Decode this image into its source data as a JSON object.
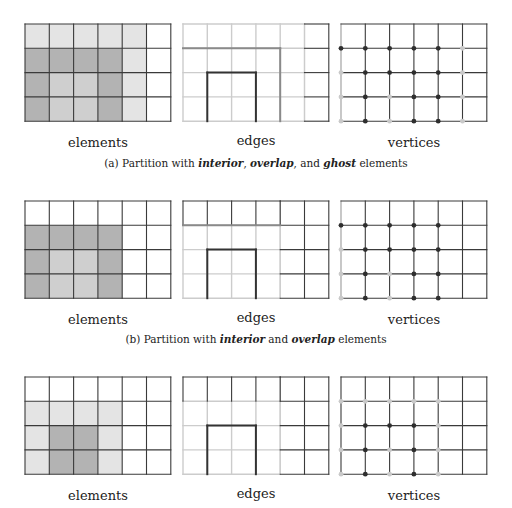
{
  "colors": {
    "interior": "#b3b3b3",
    "overlap": "#cfcfcf",
    "ghost": "#e4e4e4",
    "none": "#ffffff",
    "line_dark": "#333333",
    "line_overlap": "#8a8a8a",
    "line_ghost": "#cccccc",
    "line_plain": "#3a3a3a",
    "dot_dark": "#2e2e2e",
    "dot_light": "#c9c9c9"
  },
  "panel_labels": {
    "elements": "elements",
    "edges": "edges",
    "vertices": "vertices"
  },
  "subfigures": [
    {
      "id": "a",
      "caption": {
        "prefix": "(a) Partition with ",
        "t1": "interior",
        "sep1": ", ",
        "t2": "overlap",
        "sep2": ", and ",
        "t3": "ghost",
        "suffix": " elements"
      },
      "elements": [
        [
          "ghost",
          "ghost",
          "ghost",
          "ghost",
          "ghost",
          "none"
        ],
        [
          "interior",
          "interior",
          "interior",
          "interior",
          "ghost",
          "none"
        ],
        [
          "interior",
          "overlap",
          "overlap",
          "interior",
          "ghost",
          "none"
        ],
        [
          "interior",
          "overlap",
          "overlap",
          "interior",
          "ghost",
          "none"
        ]
      ],
      "edges": {
        "base": "line_ghost",
        "plain_cols_from": 5,
        "segments": [
          {
            "type": "h",
            "row": 1,
            "c0": 0,
            "c1": 4,
            "color": "line_overlap"
          },
          {
            "type": "v",
            "col": 4,
            "r0": 1,
            "r1": 4,
            "color": "line_overlap"
          },
          {
            "type": "h",
            "row": 2,
            "c0": 1,
            "c1": 3,
            "color": "line_dark"
          },
          {
            "type": "v",
            "col": 1,
            "r0": 2,
            "r1": 4,
            "color": "line_dark"
          },
          {
            "type": "v",
            "col": 3,
            "r0": 2,
            "r1": 4,
            "color": "line_dark"
          }
        ]
      },
      "vertices": {
        "ghost_left": true,
        "dots": [
          {
            "r": 1,
            "c": 0,
            "k": "dark"
          },
          {
            "r": 1,
            "c": 1,
            "k": "dark"
          },
          {
            "r": 1,
            "c": 2,
            "k": "dark"
          },
          {
            "r": 1,
            "c": 3,
            "k": "dark"
          },
          {
            "r": 1,
            "c": 4,
            "k": "dark"
          },
          {
            "r": 1,
            "c": 5,
            "k": "light"
          },
          {
            "r": 2,
            "c": 0,
            "k": "light"
          },
          {
            "r": 2,
            "c": 1,
            "k": "dark"
          },
          {
            "r": 2,
            "c": 2,
            "k": "dark"
          },
          {
            "r": 2,
            "c": 3,
            "k": "dark"
          },
          {
            "r": 2,
            "c": 4,
            "k": "dark"
          },
          {
            "r": 2,
            "c": 5,
            "k": "light"
          },
          {
            "r": 3,
            "c": 0,
            "k": "light"
          },
          {
            "r": 3,
            "c": 1,
            "k": "dark"
          },
          {
            "r": 3,
            "c": 2,
            "k": "light"
          },
          {
            "r": 3,
            "c": 3,
            "k": "dark"
          },
          {
            "r": 3,
            "c": 4,
            "k": "dark"
          },
          {
            "r": 3,
            "c": 5,
            "k": "light"
          },
          {
            "r": 4,
            "c": 0,
            "k": "light"
          },
          {
            "r": 4,
            "c": 1,
            "k": "dark"
          },
          {
            "r": 4,
            "c": 2,
            "k": "light"
          },
          {
            "r": 4,
            "c": 3,
            "k": "dark"
          },
          {
            "r": 4,
            "c": 4,
            "k": "dark"
          },
          {
            "r": 4,
            "c": 5,
            "k": "light"
          }
        ]
      }
    },
    {
      "id": "b",
      "caption": {
        "prefix": "(b) Partition with ",
        "t1": "interior",
        "sep1": " and ",
        "t2": "overlap",
        "sep2": "",
        "t3": "",
        "suffix": " elements"
      },
      "elements": [
        [
          "none",
          "none",
          "none",
          "none",
          "none",
          "none"
        ],
        [
          "interior",
          "interior",
          "interior",
          "interior",
          "none",
          "none"
        ],
        [
          "interior",
          "overlap",
          "overlap",
          "interior",
          "none",
          "none"
        ],
        [
          "interior",
          "overlap",
          "overlap",
          "interior",
          "none",
          "none"
        ]
      ],
      "edges": {
        "base": "line_ghost",
        "plain_cols_from": 4,
        "plain_top_row": true,
        "segments": [
          {
            "type": "h",
            "row": 1,
            "c0": 0,
            "c1": 4,
            "color": "line_overlap"
          },
          {
            "type": "h",
            "row": 2,
            "c0": 1,
            "c1": 3,
            "color": "line_dark"
          },
          {
            "type": "v",
            "col": 1,
            "r0": 2,
            "r1": 4,
            "color": "line_dark"
          },
          {
            "type": "v",
            "col": 3,
            "r0": 2,
            "r1": 4,
            "color": "line_dark"
          }
        ]
      },
      "vertices": {
        "ghost_left": true,
        "dots": [
          {
            "r": 1,
            "c": 0,
            "k": "dark"
          },
          {
            "r": 1,
            "c": 1,
            "k": "dark"
          },
          {
            "r": 1,
            "c": 2,
            "k": "dark"
          },
          {
            "r": 1,
            "c": 3,
            "k": "dark"
          },
          {
            "r": 1,
            "c": 4,
            "k": "dark"
          },
          {
            "r": 2,
            "c": 0,
            "k": "light"
          },
          {
            "r": 2,
            "c": 1,
            "k": "dark"
          },
          {
            "r": 2,
            "c": 2,
            "k": "dark"
          },
          {
            "r": 2,
            "c": 3,
            "k": "dark"
          },
          {
            "r": 2,
            "c": 4,
            "k": "dark"
          },
          {
            "r": 3,
            "c": 0,
            "k": "light"
          },
          {
            "r": 3,
            "c": 1,
            "k": "dark"
          },
          {
            "r": 3,
            "c": 2,
            "k": "light"
          },
          {
            "r": 3,
            "c": 3,
            "k": "dark"
          },
          {
            "r": 3,
            "c": 4,
            "k": "dark"
          },
          {
            "r": 4,
            "c": 0,
            "k": "light"
          },
          {
            "r": 4,
            "c": 1,
            "k": "dark"
          },
          {
            "r": 4,
            "c": 2,
            "k": "light"
          },
          {
            "r": 4,
            "c": 3,
            "k": "dark"
          },
          {
            "r": 4,
            "c": 4,
            "k": "dark"
          }
        ]
      }
    },
    {
      "id": "c",
      "caption": null,
      "elements": [
        [
          "none",
          "none",
          "none",
          "none",
          "none",
          "none"
        ],
        [
          "ghost",
          "ghost",
          "ghost",
          "ghost",
          "none",
          "none"
        ],
        [
          "ghost",
          "interior",
          "interior",
          "ghost",
          "none",
          "none"
        ],
        [
          "ghost",
          "interior",
          "interior",
          "ghost",
          "none",
          "none"
        ]
      ],
      "edges": {
        "base": "line_ghost",
        "plain_cols_from": 4,
        "plain_top_row": true,
        "segments": [
          {
            "type": "h",
            "row": 2,
            "c0": 1,
            "c1": 3,
            "color": "line_dark"
          },
          {
            "type": "v",
            "col": 1,
            "r0": 2,
            "r1": 4,
            "color": "line_dark"
          },
          {
            "type": "v",
            "col": 3,
            "r0": 2,
            "r1": 4,
            "color": "line_dark"
          }
        ]
      },
      "vertices": {
        "ghost_left": false,
        "dots": [
          {
            "r": 1,
            "c": 0,
            "k": "light"
          },
          {
            "r": 1,
            "c": 1,
            "k": "light"
          },
          {
            "r": 1,
            "c": 2,
            "k": "light"
          },
          {
            "r": 1,
            "c": 3,
            "k": "light"
          },
          {
            "r": 1,
            "c": 4,
            "k": "light"
          },
          {
            "r": 2,
            "c": 0,
            "k": "light"
          },
          {
            "r": 2,
            "c": 1,
            "k": "dark"
          },
          {
            "r": 2,
            "c": 2,
            "k": "dark"
          },
          {
            "r": 2,
            "c": 3,
            "k": "dark"
          },
          {
            "r": 2,
            "c": 4,
            "k": "light"
          },
          {
            "r": 3,
            "c": 0,
            "k": "light"
          },
          {
            "r": 3,
            "c": 1,
            "k": "dark"
          },
          {
            "r": 3,
            "c": 2,
            "k": "light"
          },
          {
            "r": 3,
            "c": 3,
            "k": "dark"
          },
          {
            "r": 3,
            "c": 4,
            "k": "light"
          },
          {
            "r": 4,
            "c": 0,
            "k": "light"
          },
          {
            "r": 4,
            "c": 1,
            "k": "dark"
          },
          {
            "r": 4,
            "c": 2,
            "k": "light"
          },
          {
            "r": 4,
            "c": 3,
            "k": "dark"
          },
          {
            "r": 4,
            "c": 4,
            "k": "light"
          }
        ]
      }
    }
  ]
}
